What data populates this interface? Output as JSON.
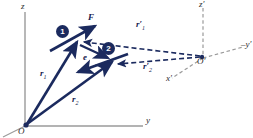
{
  "figure": {
    "background_color": "#ffffff",
    "vector_color": "#1b2a5e",
    "axis_color": "#9a9a9a",
    "label_color": "#15204d",
    "width": 253,
    "height": 138
  },
  "axes": {
    "unprimed": {
      "origin_label": "O",
      "z_label": "z",
      "y_label": "y",
      "x_label": ""
    },
    "primed": {
      "origin_label": "O′",
      "z_label": "z′",
      "y_label": "–y′",
      "x_label": "x′"
    }
  },
  "particles": [
    {
      "id": "1",
      "label": "1"
    },
    {
      "id": "2",
      "label": "2"
    }
  ],
  "vectors": {
    "force": {
      "label": "F",
      "sub": ""
    },
    "r1": {
      "label": "r",
      "sub": "1"
    },
    "r2": {
      "label": "r",
      "sub": "2"
    },
    "r1_primed": {
      "label": "r′",
      "sub": "1"
    },
    "r2_primed": {
      "label": "r′",
      "sub": "2"
    },
    "separation": {
      "label": "e",
      "sub": ""
    }
  }
}
